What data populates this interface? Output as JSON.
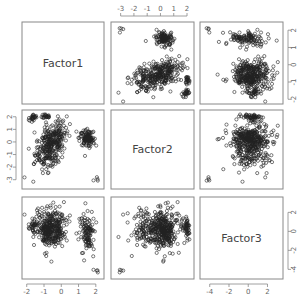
{
  "chart_data": {
    "type": "scatter",
    "title": "",
    "layout": "pairs-matrix-3x3",
    "variables": [
      "Factor1",
      "Factor2",
      "Factor3"
    ],
    "ranges": {
      "Factor1": [
        -2.1,
        2.3
      ],
      "Factor2": [
        -3.5,
        2.3
      ],
      "Factor3": [
        -4.7,
        3.3
      ]
    },
    "axes": {
      "top": {
        "variable": "Factor2",
        "ticks": [
          -3,
          -2,
          -1,
          0,
          1,
          2
        ]
      },
      "right_row1": {
        "variable": "Factor1",
        "ticks": [
          2,
          1,
          0,
          -1,
          -2
        ]
      },
      "left_row2": {
        "variable": "Factor2",
        "ticks": [
          2,
          1,
          0,
          -1,
          -2,
          -3
        ]
      },
      "right_row3": {
        "variable": "Factor3",
        "ticks": [
          2,
          0,
          -2,
          -4
        ]
      },
      "bottom_col1": {
        "variable": "Factor1",
        "ticks": [
          -2,
          -1,
          0,
          1,
          2
        ]
      },
      "bottom_col3": {
        "variable": "Factor3",
        "ticks": [
          -4,
          -2,
          0,
          2
        ]
      }
    },
    "clusters": [
      {
        "name": "main",
        "n": 330,
        "Factor1": [
          -0.6,
          0.45
        ],
        "Factor2": [
          -0.2,
          0.9
        ],
        "Factor3": [
          0.3,
          1.0
        ],
        "corr12": 0.45
      },
      {
        "name": "high-f1",
        "n": 110,
        "Factor1": [
          1.5,
          0.22
        ],
        "Factor2": [
          0.3,
          0.35
        ],
        "Factor3": [
          -0.2,
          1.0
        ],
        "corr12": 0.0
      },
      {
        "name": "upper-left",
        "n": 25,
        "Factor1": [
          -1.7,
          0.15
        ],
        "Factor2": [
          1.95,
          0.12
        ],
        "Factor3": [
          0.6,
          0.5
        ],
        "corr12": 0.0
      },
      {
        "name": "top-f2",
        "n": 22,
        "Factor1": [
          -0.85,
          0.12
        ],
        "Factor2": [
          2.1,
          0.1
        ],
        "Factor3": [
          0.2,
          0.4
        ],
        "corr12": 0.0
      },
      {
        "name": "low-tail",
        "n": 4,
        "Factor1": [
          1.9,
          0.15
        ],
        "Factor2": [
          -3.0,
          0.2
        ],
        "Factor3": [
          -4.3,
          0.2
        ],
        "corr12": 0.0
      }
    ],
    "grid": false,
    "legend": "none",
    "marker": "open-circle"
  },
  "panels": {
    "diag": [
      "Factor1",
      "Factor2",
      "Factor3"
    ]
  }
}
